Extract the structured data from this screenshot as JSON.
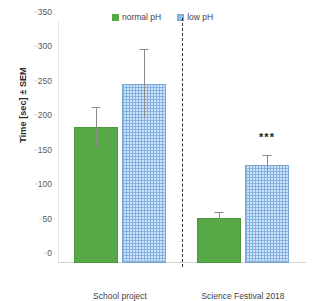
{
  "chart_data": {
    "type": "bar",
    "title": "",
    "xlabel": "",
    "ylabel": "Time [sec] ± SEM",
    "ylim": [
      0,
      350
    ],
    "yticks": [
      0,
      50,
      100,
      150,
      200,
      250,
      300,
      350
    ],
    "ytick_labels": [
      "0",
      "50",
      "100",
      "150",
      "200",
      "250",
      "300",
      "350"
    ],
    "grid": false,
    "legend_position": "top-center",
    "categories": [
      "School project",
      "Science Festival 2018"
    ],
    "series": [
      {
        "name": "normal pH",
        "color": "#57a846",
        "pattern": "solid",
        "values": [
          197,
          65
        ],
        "errors": [
          28,
          7
        ]
      },
      {
        "name": "low pH",
        "color": "#cfe4f8",
        "pattern": "checkered",
        "values": [
          260,
          142
        ],
        "errors": [
          50,
          14
        ]
      }
    ],
    "annotations": [
      {
        "text": "***",
        "category": "Science Festival 2018",
        "series": "low pH",
        "value": 175
      }
    ],
    "divider": {
      "style": "dashed",
      "between": [
        "School project",
        "Science Festival 2018"
      ]
    }
  },
  "legend": {
    "items": [
      {
        "label": "normal pH",
        "swatch": "green-solid-swatch"
      },
      {
        "label": "low pH",
        "swatch": "blue-checkered-swatch"
      }
    ]
  },
  "axes": {
    "y_title": "Time [sec] ± SEM",
    "y_tick_0": "0",
    "y_tick_1": "50",
    "y_tick_2": "100",
    "y_tick_3": "150",
    "y_tick_4": "200",
    "y_tick_5": "250",
    "y_tick_6": "300",
    "y_tick_7": "350",
    "x_label_0": "School project",
    "x_label_1": "Science Festival 2018"
  },
  "markers": {
    "significance": "***"
  }
}
